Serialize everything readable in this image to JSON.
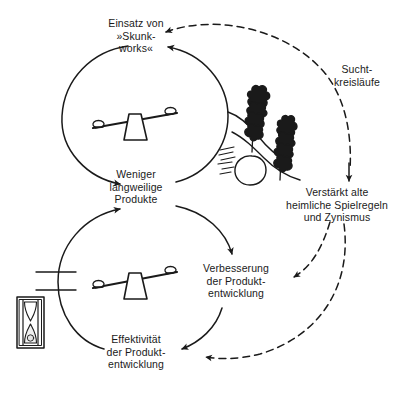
{
  "diagram": {
    "background_color": "#ffffff",
    "ink_color": "#1a1a1a",
    "nodes": [
      {
        "id": "skunkworks",
        "label": "Einsatz von\n»Skunk-\nworks«"
      },
      {
        "id": "weniger",
        "label": "Weniger\nlangweilige\nProdukte"
      },
      {
        "id": "effektivitaet",
        "label": "Effektivität\nder Produkt-\nentwicklung"
      },
      {
        "id": "verbesserung",
        "label": "Verbesserung\nder Produkt-\nentwicklung"
      },
      {
        "id": "verstaerkt",
        "label": "Verstärkt alte\nheimliche Spielregeln\nund Zynismus"
      },
      {
        "id": "sucht",
        "label": "Sucht-\nkreisläufe"
      }
    ],
    "icons": [
      {
        "id": "seesaw-upper",
        "name": "seesaw-balance-icon"
      },
      {
        "id": "seesaw-lower",
        "name": "seesaw-balance-icon"
      },
      {
        "id": "hourglass",
        "name": "hourglass-delay-icon"
      },
      {
        "id": "plants",
        "name": "plants-hillside-icon"
      },
      {
        "id": "delay-marks",
        "name": "delay-hash-marks-icon"
      }
    ],
    "loops": [
      {
        "id": "upper-loop",
        "name": "upper-reinforcing-loop",
        "style": "solid"
      },
      {
        "id": "lower-loop",
        "name": "lower-reinforcing-loop",
        "style": "solid"
      }
    ],
    "connectors": [
      {
        "id": "dashed-sucht-to-skunkworks",
        "style": "dashed"
      },
      {
        "id": "dashed-verstaerkt-to-verbesserung",
        "style": "dashed"
      },
      {
        "id": "dashed-verstaerkt-to-effektivitaet",
        "style": "dashed"
      },
      {
        "id": "solid-verstaerkt-inflow",
        "style": "solid"
      }
    ]
  }
}
